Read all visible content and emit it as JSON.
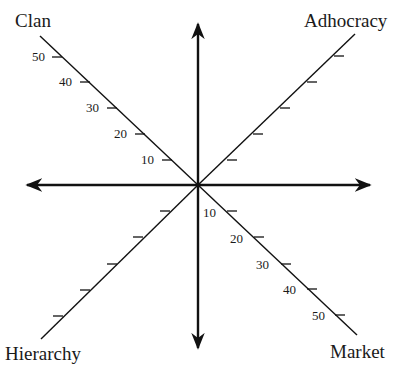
{
  "diagram": {
    "type": "competing-values-framework-axes",
    "center": [
      198,
      185
    ],
    "quadrants": [
      {
        "id": "clan",
        "label": "Clan",
        "position": "top-left"
      },
      {
        "id": "adhocracy",
        "label": "Adhocracy",
        "position": "top-right"
      },
      {
        "id": "hierarchy",
        "label": "Hierarchy",
        "position": "bottom-left"
      },
      {
        "id": "market",
        "label": "Market",
        "position": "bottom-right"
      }
    ],
    "axes": {
      "vertical": {
        "arrows": "both"
      },
      "horizontal": {
        "arrows": "both"
      }
    },
    "diagonal_scales": {
      "clan": {
        "ticks": [
          "10",
          "20",
          "30",
          "40",
          "50"
        ],
        "labeled": true
      },
      "adhocracy": {
        "ticks": 5,
        "labeled": false
      },
      "hierarchy": {
        "ticks": 5,
        "labeled": false
      },
      "market": {
        "ticks": [
          "10",
          "20",
          "30",
          "40",
          "50"
        ],
        "labeled": true
      }
    },
    "line_color": "#111111"
  }
}
